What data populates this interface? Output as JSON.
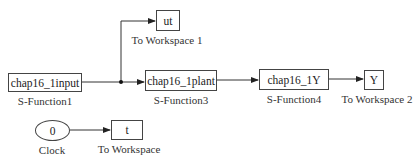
{
  "diagram": {
    "type": "simulink-block-diagram",
    "blocks": [
      {
        "id": "sfun1",
        "text": "chap16_1input",
        "label": "S-Function1",
        "kind": "s-function"
      },
      {
        "id": "ut",
        "text": "ut",
        "label": "To Workspace 1",
        "kind": "to-workspace"
      },
      {
        "id": "sfun3",
        "text": "chap16_1plant",
        "label": "S-Function3",
        "kind": "s-function"
      },
      {
        "id": "sfun4",
        "text": "chap16_1Y",
        "label": "S-Function4",
        "kind": "s-function"
      },
      {
        "id": "Y",
        "text": "Y",
        "label": "To Workspace 2",
        "kind": "to-workspace"
      },
      {
        "id": "clock",
        "text": "0",
        "label": "Clock",
        "kind": "clock"
      },
      {
        "id": "t",
        "text": "t",
        "label": "To Workspace",
        "kind": "to-workspace"
      }
    ],
    "connections": [
      {
        "from": "S-Function1",
        "to": "S-Function3"
      },
      {
        "from": "S-Function1",
        "to": "To Workspace 1",
        "via": "branch-junction"
      },
      {
        "from": "S-Function3",
        "to": "S-Function4"
      },
      {
        "from": "S-Function4",
        "to": "To Workspace 2"
      },
      {
        "from": "Clock",
        "to": "To Workspace"
      }
    ]
  },
  "colors": {
    "line": "#333333",
    "border": "#444444",
    "background": "#ffffff"
  }
}
